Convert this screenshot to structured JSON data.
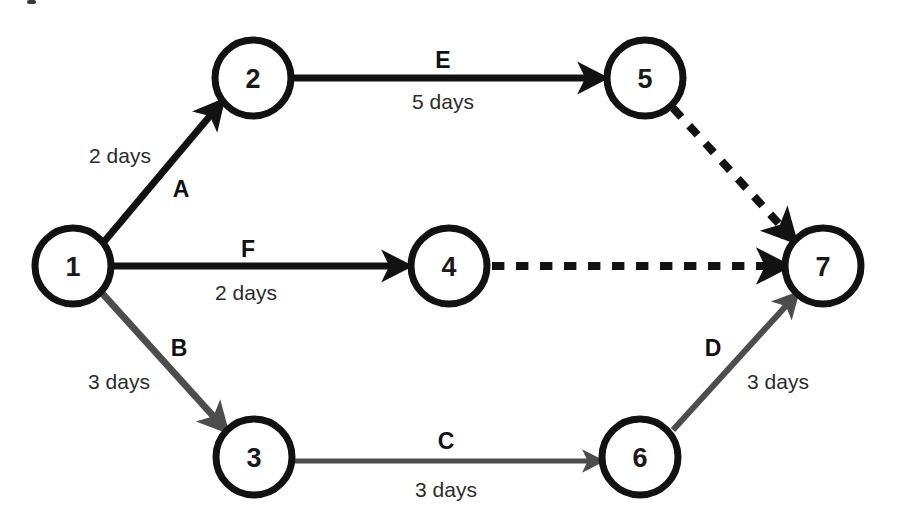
{
  "diagram": {
    "canvas": {
      "width": 898,
      "height": 528
    },
    "colors": {
      "background": "#ffffff",
      "black": "#121212",
      "gray": "#4d4d4d",
      "node_stroke": "#121212",
      "node_fill": "#ffffff",
      "text": "#1a1a1a"
    },
    "nodes": [
      {
        "id": "node-1",
        "label": "1",
        "cx": 73,
        "cy": 266,
        "r": 38
      },
      {
        "id": "node-2",
        "label": "2",
        "cx": 253,
        "cy": 78,
        "r": 38
      },
      {
        "id": "node-3",
        "label": "3",
        "cx": 254,
        "cy": 457,
        "r": 38
      },
      {
        "id": "node-4",
        "label": "4",
        "cx": 449,
        "cy": 266,
        "r": 38
      },
      {
        "id": "node-5",
        "label": "5",
        "cx": 645,
        "cy": 78,
        "r": 38
      },
      {
        "id": "node-6",
        "label": "6",
        "cx": 640,
        "cy": 457,
        "r": 38
      },
      {
        "id": "node-7",
        "label": "7",
        "cx": 823,
        "cy": 266,
        "r": 38
      }
    ],
    "edges": [
      {
        "id": "edge-A",
        "activity": "A",
        "duration": "2 days",
        "from": "1",
        "to": "2",
        "style": "solid",
        "color": "black",
        "width": 7,
        "x1": 103,
        "y1": 243,
        "x2": 220,
        "y2": 104,
        "activity_x": 181,
        "activity_y": 189,
        "duration_x": 120,
        "duration_y": 155
      },
      {
        "id": "edge-B",
        "activity": "B",
        "duration": "3 days",
        "from": "1",
        "to": "3",
        "style": "solid",
        "color": "gray",
        "width": 7,
        "x1": 101,
        "y1": 292,
        "x2": 224,
        "y2": 428,
        "activity_x": 179,
        "activity_y": 348,
        "duration_x": 119,
        "duration_y": 381
      },
      {
        "id": "edge-C",
        "activity": "C",
        "duration": "3 days",
        "from": "3",
        "to": "6",
        "style": "solid",
        "color": "gray",
        "width": 5,
        "x1": 293,
        "y1": 461,
        "x2": 599,
        "y2": 461,
        "activity_x": 446,
        "activity_y": 441,
        "duration_x": 446,
        "duration_y": 489
      },
      {
        "id": "edge-D",
        "activity": "D",
        "duration": "3 days",
        "from": "6",
        "to": "7",
        "style": "solid",
        "color": "gray",
        "width": 6,
        "x1": 673,
        "y1": 430,
        "x2": 795,
        "y2": 296,
        "activity_x": 713,
        "activity_y": 348,
        "duration_x": 778,
        "duration_y": 381
      },
      {
        "id": "edge-E",
        "activity": "E",
        "duration": "5 days",
        "from": "2",
        "to": "5",
        "style": "solid",
        "color": "black",
        "width": 7,
        "x1": 294,
        "y1": 78,
        "x2": 601,
        "y2": 78,
        "activity_x": 443,
        "activity_y": 60,
        "duration_x": 443,
        "duration_y": 101
      },
      {
        "id": "edge-F",
        "activity": "F",
        "duration": "2 days",
        "from": "1",
        "to": "4",
        "style": "solid",
        "color": "black",
        "width": 7,
        "x1": 114,
        "y1": 266,
        "x2": 405,
        "y2": 266,
        "activity_x": 248,
        "activity_y": 249,
        "duration_x": 246,
        "duration_y": 292
      },
      {
        "id": "edge-dummy-5-7",
        "activity": "",
        "duration": "",
        "from": "5",
        "to": "7",
        "style": "dashed",
        "color": "black",
        "width": 8,
        "x1": 673,
        "y1": 108,
        "x2": 792,
        "y2": 238,
        "activity_x": 0,
        "activity_y": 0,
        "duration_x": 0,
        "duration_y": 0
      },
      {
        "id": "edge-dummy-4-7",
        "activity": "",
        "duration": "",
        "from": "4",
        "to": "7",
        "style": "dashed",
        "color": "black",
        "width": 8,
        "x1": 492,
        "y1": 266,
        "x2": 783,
        "y2": 266,
        "activity_x": 0,
        "activity_y": 0,
        "duration_x": 0,
        "duration_y": 0
      }
    ]
  }
}
